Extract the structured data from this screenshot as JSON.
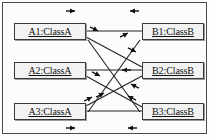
{
  "diagram": {
    "type": "uml-object-collaboration-diagram",
    "frame": {
      "visible": true,
      "color": "#4a4a4a"
    },
    "colors": {
      "line": "#222222",
      "box_border": "#3a3a3a",
      "box_fill": "#f2f2f2",
      "text": "#111111",
      "frame": "#4a4a4a"
    },
    "objects": [
      {
        "id": "A1",
        "label": "A1:ClassA",
        "column": "left",
        "row": 1,
        "x": 14,
        "y": 23,
        "w": 72,
        "h": 17
      },
      {
        "id": "A2",
        "label": "A2:ClassA",
        "column": "left",
        "row": 2,
        "x": 14,
        "y": 62,
        "w": 72,
        "h": 17
      },
      {
        "id": "A3",
        "label": "A3:ClassA",
        "column": "left",
        "row": 3,
        "x": 14,
        "y": 103,
        "w": 72,
        "h": 17
      },
      {
        "id": "B1",
        "label": "B1:ClassB",
        "column": "right",
        "row": 1,
        "x": 142,
        "y": 23,
        "w": 62,
        "h": 17
      },
      {
        "id": "B2",
        "label": "B2:ClassB",
        "column": "right",
        "row": 2,
        "x": 142,
        "y": 62,
        "w": 62,
        "h": 17
      },
      {
        "id": "B3",
        "label": "B3:ClassB",
        "column": "right",
        "row": 3,
        "x": 142,
        "y": 103,
        "w": 62,
        "h": 17
      }
    ],
    "links": [
      {
        "name": "link-a1-b1",
        "from": "A1",
        "to": "B1",
        "kind": "horizontal",
        "x1": 86,
        "y1": 31,
        "x2": 142,
        "y2": 31
      },
      {
        "name": "link-a2-b2",
        "from": "A2",
        "to": "B2",
        "kind": "horizontal",
        "x1": 86,
        "y1": 70,
        "x2": 142,
        "y2": 70
      },
      {
        "name": "link-a3-b3",
        "from": "A3",
        "to": "B3",
        "kind": "horizontal",
        "x1": 86,
        "y1": 111,
        "x2": 142,
        "y2": 111
      },
      {
        "name": "link-a1-b2",
        "from": "A1",
        "to": "B2",
        "kind": "diagonal",
        "x1": 86,
        "y1": 37,
        "x2": 142,
        "y2": 67
      },
      {
        "name": "link-a2-b3",
        "from": "A2",
        "to": "B3",
        "kind": "diagonal",
        "x1": 86,
        "y1": 76,
        "x2": 142,
        "y2": 107
      },
      {
        "name": "link-a3-b2",
        "from": "A3",
        "to": "B2",
        "kind": "diagonal",
        "x1": 86,
        "y1": 106,
        "x2": 142,
        "y2": 76
      },
      {
        "name": "link-a3-b1",
        "from": "A3",
        "to": "B1",
        "kind": "diagonal",
        "x1": 88,
        "y1": 112,
        "x2": 140,
        "y2": 40
      },
      {
        "name": "link-a1-b3",
        "from": "A1",
        "to": "B3",
        "kind": "diagonal",
        "x1": 88,
        "y1": 40,
        "x2": 140,
        "y2": 112
      }
    ],
    "arrow_markers": [
      {
        "name": "arrow-top-left-rightward",
        "x": 75,
        "y": 11,
        "direction": "right",
        "context": "above-A1-B1-line"
      },
      {
        "name": "arrow-top-right-leftward",
        "x": 130,
        "y": 11,
        "direction": "left",
        "context": "above-A1-B1-line"
      },
      {
        "name": "arrow-a1-b2-downright",
        "x": 98,
        "y": 31,
        "direction": "down-right",
        "context": "A1-to-B2"
      },
      {
        "name": "arrow-a3-b1-upright",
        "x": 128,
        "y": 33,
        "direction": "up-right",
        "context": "A3-to-B1"
      },
      {
        "name": "arrow-a1-b3-downright",
        "x": 136,
        "y": 52,
        "direction": "down-right",
        "context": "A1-to-B3"
      },
      {
        "name": "arrow-mid-leftward",
        "x": 122,
        "y": 70,
        "direction": "left",
        "context": "on-A2-B2-line"
      },
      {
        "name": "arrow-a2-b3-downright",
        "x": 100,
        "y": 76,
        "direction": "down-right",
        "context": "A2-to-B3"
      },
      {
        "name": "arrow-b2-a3-upright-outer",
        "x": 104,
        "y": 93,
        "direction": "up-right",
        "context": "A3-to-B2"
      },
      {
        "name": "arrow-b2-a3-upright-inner",
        "x": 92,
        "y": 97,
        "direction": "up-right",
        "context": "A3-to-B2"
      },
      {
        "name": "arrow-b3-a1-upleft-outer",
        "x": 131,
        "y": 84,
        "direction": "up-left",
        "context": "toward-B2"
      },
      {
        "name": "arrow-b3-a1-upleft-inner",
        "x": 128,
        "y": 96,
        "direction": "up-left",
        "context": "toward-B2"
      },
      {
        "name": "arrow-bottom-left-rightward",
        "x": 75,
        "y": 128,
        "direction": "right",
        "context": "below-A3-B3-line"
      },
      {
        "name": "arrow-bottom-right-leftward",
        "x": 128,
        "y": 128,
        "direction": "left",
        "context": "below-A3-B3-line"
      }
    ]
  }
}
